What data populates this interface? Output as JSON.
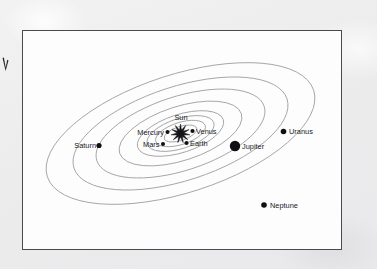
{
  "figure": {
    "frame": {
      "x": 22,
      "y": 30,
      "width": 320,
      "height": 220
    },
    "center": {
      "x": 180.5,
      "y": 133.5
    },
    "orbit_tilt_degrees": -18,
    "colors": {
      "paper": "#eeeeef",
      "figure_background": "#fdfdfd",
      "frame_border": "#4a4a4e",
      "orbit_line": "#9a9a9e",
      "body_fill": "#101014",
      "label_text": "#1a1a1e"
    }
  },
  "sun": {
    "name": "Sun",
    "label": "Sun",
    "x": 180.5,
    "y": 133.5,
    "label_x": 181,
    "label_y": 120,
    "label_anchor": "middle",
    "burst_outer_radius": 9.5,
    "burst_inner_radius": 3.6,
    "burst_points": 11
  },
  "planets": [
    {
      "name": "Mercury",
      "label": "Mercury",
      "dot_x": 167.5,
      "dot_y": 132.0,
      "dot_radius": 2.0,
      "label_x": 164.0,
      "label_y": 134.5,
      "label_anchor": "end",
      "orbit_rx": 17,
      "orbit_ry": 7
    },
    {
      "name": "Venus",
      "label": "Venus",
      "dot_x": 192.5,
      "dot_y": 131.0,
      "dot_radius": 2.1,
      "label_x": 196.0,
      "label_y": 133.5,
      "label_anchor": "start",
      "orbit_rx": 26,
      "orbit_ry": 11
    },
    {
      "name": "Earth",
      "label": "Earth",
      "dot_x": 186.5,
      "dot_y": 143.0,
      "dot_radius": 2.1,
      "label_x": 190.0,
      "label_y": 145.5,
      "label_anchor": "start",
      "orbit_rx": 35,
      "orbit_ry": 15
    },
    {
      "name": "Mars",
      "label": "Mars",
      "dot_x": 163.0,
      "dot_y": 144.0,
      "dot_radius": 2.0,
      "label_x": 159.5,
      "label_y": 146.5,
      "label_anchor": "end",
      "orbit_rx": 45,
      "orbit_ry": 19
    },
    {
      "name": "Jupiter",
      "label": "Jupiter",
      "dot_x": 235.0,
      "dot_y": 146.0,
      "dot_radius": 5.2,
      "label_x": 242.0,
      "label_y": 148.5,
      "label_anchor": "start",
      "orbit_rx": 64,
      "orbit_ry": 27
    },
    {
      "name": "Saturn",
      "label": "Saturn",
      "dot_x": 99.0,
      "dot_y": 145.5,
      "dot_radius": 2.6,
      "label_x": 96.0,
      "label_y": 148.0,
      "label_anchor": "end",
      "orbit_rx": 88,
      "orbit_ry": 37
    },
    {
      "name": "Uranus",
      "label": "Uranus",
      "dot_x": 283.5,
      "dot_y": 131.5,
      "dot_radius": 2.8,
      "label_x": 289.0,
      "label_y": 134.0,
      "label_anchor": "start",
      "orbit_rx": 112,
      "orbit_ry": 47
    },
    {
      "name": "Neptune",
      "label": "Neptune",
      "dot_x": 264.0,
      "dot_y": 205.0,
      "dot_radius": 2.8,
      "label_x": 270.0,
      "label_y": 207.5,
      "label_anchor": "start",
      "orbit_rx": 140,
      "orbit_ry": 59
    }
  ]
}
